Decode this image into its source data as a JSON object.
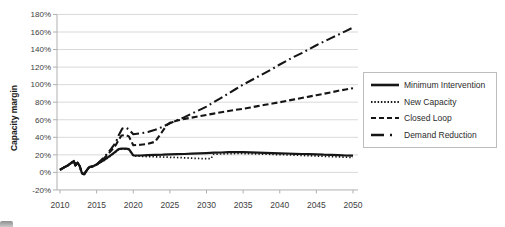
{
  "chart_data": {
    "type": "line",
    "ylabel": "Capacity margin",
    "xlabel": "",
    "line_color": "#151515",
    "grid": "horizontal-only",
    "gridline_color": "#d9d9d9",
    "axis_color": "#b0b0b0",
    "legend_position": "right-outside-boxed",
    "xlim": [
      2010,
      2050
    ],
    "ylim": [
      -20,
      180
    ],
    "x_ticks": [
      2010,
      2015,
      2020,
      2025,
      2030,
      2035,
      2040,
      2045,
      2050
    ],
    "x_tick_labels": [
      "2010",
      "2015",
      "2020",
      "2025",
      "2030",
      "2035",
      "2040",
      "2045",
      "2050"
    ],
    "y_ticks": [
      -20,
      0,
      20,
      40,
      60,
      80,
      100,
      120,
      140,
      160,
      180
    ],
    "y_tick_labels": [
      "-20%",
      "0%",
      "20%",
      "40%",
      "60%",
      "80%",
      "100%",
      "120%",
      "140%",
      "160%",
      "180%"
    ],
    "series": [
      {
        "name": "Minimum Intervention",
        "style": "solid",
        "points": [
          [
            2010,
            3
          ],
          [
            2010.5,
            5.5
          ],
          [
            2011,
            7.5
          ],
          [
            2011.4,
            10
          ],
          [
            2011.9,
            13
          ],
          [
            2012.1,
            8
          ],
          [
            2012.4,
            11
          ],
          [
            2012.7,
            7
          ],
          [
            2013,
            -1
          ],
          [
            2013.3,
            -2
          ],
          [
            2013.7,
            3
          ],
          [
            2014,
            6
          ],
          [
            2014.5,
            7
          ],
          [
            2015,
            9
          ],
          [
            2016,
            14
          ],
          [
            2017,
            20
          ],
          [
            2017.5,
            23
          ],
          [
            2018,
            26.5
          ],
          [
            2018.4,
            27
          ],
          [
            2019,
            27
          ],
          [
            2019.4,
            26.5
          ],
          [
            2020,
            19.5
          ],
          [
            2021,
            19.3
          ],
          [
            2022,
            19.6
          ],
          [
            2023,
            20
          ],
          [
            2024,
            20.2
          ],
          [
            2025,
            20.5
          ],
          [
            2026,
            20.8
          ],
          [
            2027,
            21
          ],
          [
            2028,
            21.3
          ],
          [
            2029,
            21.6
          ],
          [
            2030,
            22
          ],
          [
            2031,
            22.4
          ],
          [
            2032,
            22.7
          ],
          [
            2033,
            23
          ],
          [
            2034,
            23
          ],
          [
            2035,
            23
          ],
          [
            2036,
            22.8
          ],
          [
            2037,
            22.6
          ],
          [
            2038,
            22.3
          ],
          [
            2039,
            22
          ],
          [
            2040,
            21.8
          ],
          [
            2041,
            21.5
          ],
          [
            2042,
            21.2
          ],
          [
            2043,
            21
          ],
          [
            2044,
            20.8
          ],
          [
            2045,
            20.5
          ],
          [
            2046,
            20.2
          ],
          [
            2047,
            20
          ],
          [
            2048,
            19.7
          ],
          [
            2049,
            19.3
          ],
          [
            2050,
            19
          ]
        ]
      },
      {
        "name": "New Capacity",
        "style": "dotted",
        "points": [
          [
            2010,
            3
          ],
          [
            2010.5,
            5.5
          ],
          [
            2011,
            7.5
          ],
          [
            2011.4,
            10
          ],
          [
            2011.9,
            13
          ],
          [
            2012.1,
            8
          ],
          [
            2012.4,
            11
          ],
          [
            2012.7,
            7
          ],
          [
            2013,
            -1
          ],
          [
            2013.3,
            -2
          ],
          [
            2013.7,
            3
          ],
          [
            2014,
            6
          ],
          [
            2014.5,
            7
          ],
          [
            2015,
            9
          ],
          [
            2016,
            13.5
          ],
          [
            2017,
            19.5
          ],
          [
            2017.5,
            22.5
          ],
          [
            2018,
            26
          ],
          [
            2018.4,
            26.5
          ],
          [
            2019,
            26.5
          ],
          [
            2019.4,
            26
          ],
          [
            2020,
            18.8
          ],
          [
            2021,
            18.3
          ],
          [
            2022,
            18
          ],
          [
            2023,
            17.8
          ],
          [
            2024,
            17.5
          ],
          [
            2025,
            17.2
          ],
          [
            2026,
            17
          ],
          [
            2027,
            16.6
          ],
          [
            2028,
            16.2
          ],
          [
            2029,
            15.8
          ],
          [
            2030,
            15.6
          ],
          [
            2030.6,
            15.6
          ],
          [
            2031,
            20.8
          ],
          [
            2032,
            21
          ],
          [
            2033,
            21.3
          ],
          [
            2034,
            21.5
          ],
          [
            2035,
            21.5
          ],
          [
            2036,
            21.3
          ],
          [
            2037,
            21
          ],
          [
            2038,
            20.8
          ],
          [
            2039,
            20.5
          ],
          [
            2040,
            20.2
          ],
          [
            2041,
            20
          ],
          [
            2042,
            19.7
          ],
          [
            2043,
            19.4
          ],
          [
            2044,
            19
          ],
          [
            2045,
            18.7
          ],
          [
            2046,
            18.4
          ],
          [
            2047,
            18
          ],
          [
            2048,
            17.7
          ],
          [
            2049,
            17.3
          ],
          [
            2050,
            17
          ]
        ]
      },
      {
        "name": "Closed Loop",
        "style": "dashed",
        "points": [
          [
            2010,
            3
          ],
          [
            2010.5,
            5.5
          ],
          [
            2011,
            7.5
          ],
          [
            2011.4,
            10
          ],
          [
            2011.9,
            13
          ],
          [
            2012.1,
            8
          ],
          [
            2012.4,
            11
          ],
          [
            2012.7,
            7
          ],
          [
            2013,
            -1
          ],
          [
            2013.3,
            -2
          ],
          [
            2013.7,
            3
          ],
          [
            2014,
            6
          ],
          [
            2014.5,
            7
          ],
          [
            2015,
            9
          ],
          [
            2016,
            16
          ],
          [
            2017,
            25
          ],
          [
            2017.6,
            31
          ],
          [
            2018,
            37
          ],
          [
            2018.4,
            42
          ],
          [
            2019,
            42.5
          ],
          [
            2019.4,
            41
          ],
          [
            2020,
            31
          ],
          [
            2021,
            31.5
          ],
          [
            2022,
            32.5
          ],
          [
            2023,
            35
          ],
          [
            2023.4,
            40
          ],
          [
            2024,
            47
          ],
          [
            2024.6,
            54
          ],
          [
            2025,
            56.5
          ],
          [
            2026,
            59
          ],
          [
            2027,
            61
          ],
          [
            2028,
            62.5
          ],
          [
            2029,
            64
          ],
          [
            2030,
            65.5
          ],
          [
            2031,
            67
          ],
          [
            2032,
            68.5
          ],
          [
            2033,
            70
          ],
          [
            2034,
            71.3
          ],
          [
            2035,
            72.5
          ],
          [
            2036,
            74
          ],
          [
            2037,
            75.5
          ],
          [
            2038,
            77
          ],
          [
            2039,
            78.5
          ],
          [
            2040,
            80
          ],
          [
            2041,
            81.6
          ],
          [
            2042,
            83.2
          ],
          [
            2043,
            84.8
          ],
          [
            2044,
            86.4
          ],
          [
            2045,
            88
          ],
          [
            2046,
            89.6
          ],
          [
            2047,
            91.2
          ],
          [
            2048,
            93
          ],
          [
            2049,
            94.5
          ],
          [
            2050,
            96
          ]
        ]
      },
      {
        "name": "Demand Reduction",
        "style": "dashdot",
        "points": [
          [
            2010,
            3
          ],
          [
            2010.5,
            5.5
          ],
          [
            2011,
            7.5
          ],
          [
            2011.4,
            10
          ],
          [
            2011.9,
            13
          ],
          [
            2012.1,
            8
          ],
          [
            2012.4,
            11
          ],
          [
            2012.7,
            7
          ],
          [
            2013,
            -1
          ],
          [
            2013.3,
            -2
          ],
          [
            2013.7,
            3
          ],
          [
            2014,
            6
          ],
          [
            2014.5,
            7
          ],
          [
            2015,
            9
          ],
          [
            2016,
            17
          ],
          [
            2017,
            27
          ],
          [
            2017.6,
            34
          ],
          [
            2018,
            42
          ],
          [
            2018.5,
            50
          ],
          [
            2019,
            51
          ],
          [
            2019.4,
            49
          ],
          [
            2020,
            43.5
          ],
          [
            2021,
            44.5
          ],
          [
            2022,
            46
          ],
          [
            2023,
            48.5
          ],
          [
            2024,
            52
          ],
          [
            2025,
            56
          ],
          [
            2026,
            59.5
          ],
          [
            2027,
            63
          ],
          [
            2028,
            67
          ],
          [
            2029,
            71
          ],
          [
            2030,
            75
          ],
          [
            2031,
            80
          ],
          [
            2032,
            85
          ],
          [
            2033,
            90
          ],
          [
            2034,
            95
          ],
          [
            2035,
            100
          ],
          [
            2036,
            104.5
          ],
          [
            2037,
            109
          ],
          [
            2038,
            113.5
          ],
          [
            2039,
            118
          ],
          [
            2040,
            123
          ],
          [
            2041,
            127.5
          ],
          [
            2042,
            132
          ],
          [
            2043,
            136
          ],
          [
            2044,
            140.5
          ],
          [
            2045,
            145
          ],
          [
            2046,
            149
          ],
          [
            2047,
            153
          ],
          [
            2048,
            157
          ],
          [
            2049,
            161
          ],
          [
            2050,
            165
          ]
        ]
      }
    ]
  },
  "decorations": {
    "corner_partial_icon": "cropped-grey-icon-bottom-left"
  }
}
